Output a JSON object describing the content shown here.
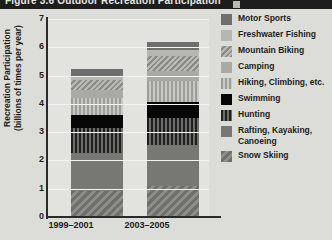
{
  "header": {
    "title": "Figure 3.6  Outdoor Recreation Participation",
    "corner_icon": "page-corner-marker"
  },
  "chart_data": {
    "type": "bar",
    "subtype": "stacked-vertical",
    "title": "",
    "xlabel": "",
    "ylabel": "Recreation Participation (billions of times per year)",
    "ylabel_line1": "Recreation Participation",
    "ylabel_line2": "(billions of times per year)",
    "categories": [
      "1999–2001",
      "2003–2005"
    ],
    "ylim": [
      0,
      7
    ],
    "yticks": [
      0,
      1,
      2,
      3,
      4,
      5,
      6,
      7
    ],
    "ytick_labels": [
      "0",
      "1",
      "2",
      "3",
      "4",
      "5",
      "6",
      "7"
    ],
    "grid": true,
    "legend_position": "right",
    "totals": [
      5.25,
      6.2
    ],
    "series": [
      {
        "name": "Motor Sports",
        "values": [
          0.25,
          0.3
        ],
        "color": "#6e6e6e",
        "pattern": "solid"
      },
      {
        "name": "Freshwater Fishing",
        "values": [
          0.15,
          0.2
        ],
        "color": "#b6b6b2",
        "pattern": "solid"
      },
      {
        "name": "Mountain Biking",
        "values": [
          0.35,
          0.55
        ],
        "color": "#b9b9b5",
        "pattern": "diagonal"
      },
      {
        "name": "Camping",
        "values": [
          0.3,
          0.35
        ],
        "color": "#a9a9a5",
        "pattern": "solid"
      },
      {
        "name": "Hiking, Climbing, etc.",
        "values": [
          0.6,
          0.75
        ],
        "color": "#9c9c98",
        "pattern": "vertical-light"
      },
      {
        "name": "Swimming",
        "values": [
          0.45,
          0.55
        ],
        "color": "#070707",
        "pattern": "solid"
      },
      {
        "name": "Hunting",
        "values": [
          0.9,
          0.95
        ],
        "color": "#1f1f1f",
        "pattern": "vertical-dark"
      },
      {
        "name": "Rafting, Kayaking, Canoeing",
        "values": [
          1.35,
          1.45
        ],
        "color": "#777773",
        "pattern": "solid"
      },
      {
        "name": "Snow Skiing",
        "values": [
          0.9,
          1.1
        ],
        "color": "#6f6f6b",
        "pattern": "diagonal"
      }
    ],
    "legend": [
      "Motor Sports",
      "Freshwater Fishing",
      "Mountain Biking",
      "Camping",
      "Hiking, Climbing, etc.",
      "Swimming",
      "Hunting",
      "Rafting, Kayaking, Canoeing",
      "Snow Skiing"
    ]
  }
}
